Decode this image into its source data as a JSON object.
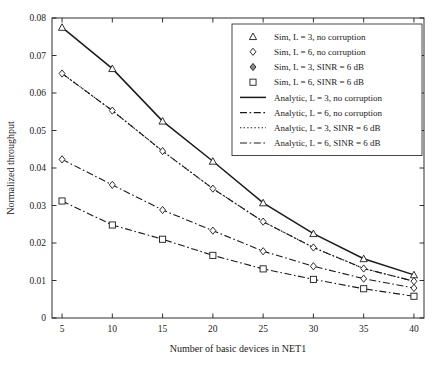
{
  "chart_data": {
    "type": "line",
    "title": "",
    "xlabel": "Number of basic devices in NET1",
    "ylabel": "Normalized throughput",
    "x": [
      5,
      10,
      15,
      20,
      25,
      30,
      35,
      40
    ],
    "xlim": [
      4,
      41
    ],
    "ylim": [
      0,
      0.08
    ],
    "xticks": [
      5,
      10,
      15,
      20,
      25,
      30,
      35,
      40
    ],
    "xtick_labels": [
      "5",
      "10",
      "15",
      "20",
      "25",
      "30",
      "35",
      "40"
    ],
    "yticks": [
      0,
      0.01,
      0.02,
      0.03,
      0.04,
      0.05,
      0.06,
      0.07,
      0.08
    ],
    "ytick_labels": [
      "0",
      "0.01",
      "0.02",
      "0.03",
      "0.04",
      "0.05",
      "0.06",
      "0.07",
      "0.08"
    ],
    "grid": false,
    "legend_position": "top-right",
    "series": [
      {
        "name": "Sim, L = 3, no corruption",
        "kind": "markers",
        "marker": "triangle",
        "color": "#1a1a1a",
        "values": [
          0.0775,
          0.0665,
          0.0525,
          0.0418,
          0.0307,
          0.0225,
          0.0158,
          0.0115
        ]
      },
      {
        "name": "Sim, L = 6, no corruption",
        "kind": "markers",
        "marker": "diamond",
        "color": "#1a1a1a",
        "values": [
          0.0652,
          0.0553,
          0.0445,
          0.0345,
          0.0257,
          0.0188,
          0.0132,
          0.0098
        ]
      },
      {
        "name": "Sim, L = 3, SINR = 6 dB",
        "kind": "markers",
        "marker": "diamond",
        "color": "#1a1a1a",
        "values": [
          0.0423,
          0.0355,
          0.0288,
          0.0233,
          0.0178,
          0.0138,
          0.0105,
          0.008
        ]
      },
      {
        "name": "Sim, L = 6, SINR = 6 dB",
        "kind": "markers",
        "marker": "square",
        "color": "#1a1a1a",
        "values": [
          0.0312,
          0.0248,
          0.021,
          0.0167,
          0.0131,
          0.0103,
          0.0078,
          0.0058
        ]
      },
      {
        "name": "Analytic, L = 3, no corruption",
        "kind": "line",
        "style": "solid",
        "color": "#1a1a1a",
        "values": [
          0.0775,
          0.0665,
          0.0525,
          0.0418,
          0.0307,
          0.0225,
          0.0158,
          0.0115
        ]
      },
      {
        "name": "Analytic, L = 6, no corruption",
        "kind": "line",
        "style": "dashdot",
        "color": "#1a1a1a",
        "values": [
          0.0652,
          0.0553,
          0.0445,
          0.0345,
          0.0257,
          0.0188,
          0.0132,
          0.0098
        ]
      },
      {
        "name": "Analytic, L = 3, SINR = 6 dB",
        "kind": "line",
        "style": "dotted",
        "color": "#1a1a1a",
        "values": [
          0.0652,
          0.0553,
          0.0445,
          0.0345,
          0.0257,
          0.0188,
          0.0132,
          0.0098
        ]
      },
      {
        "name": "Analytic, L = 6, SINR = 6 dB",
        "kind": "line",
        "style": "dashdot",
        "color": "#1a1a1a",
        "values": [
          0.0423,
          0.0355,
          0.0288,
          0.0233,
          0.0178,
          0.0138,
          0.0105,
          0.008
        ]
      },
      {
        "name": "Analytic, L = 6, SINR = 6 dB (lower)",
        "kind": "line",
        "style": "dashdot",
        "color": "#1a1a1a",
        "values": [
          0.0312,
          0.0248,
          0.021,
          0.0167,
          0.0131,
          0.0103,
          0.0078,
          0.0058
        ]
      }
    ],
    "legend_entries": [
      {
        "label": "Sim, L = 3, no corruption",
        "marker": "triangle",
        "line": "none"
      },
      {
        "label": "Sim, L = 6, no corruption",
        "marker": "diamond",
        "line": "none"
      },
      {
        "label": "Sim, L = 3, SINR = 6 dB",
        "marker": "diamond-filled",
        "line": "none"
      },
      {
        "label": "Sim, L = 6, SINR = 6 dB",
        "marker": "square",
        "line": "none"
      },
      {
        "label": "Analytic, L = 3, no corruption",
        "marker": "none",
        "line": "solid"
      },
      {
        "label": "Analytic, L = 6, no corruption",
        "marker": "none",
        "line": "dashdot"
      },
      {
        "label": "Analytic, L = 3, SINR = 6 dB",
        "marker": "none",
        "line": "dotted"
      },
      {
        "label": "Analytic, L = 6, SINR = 6 dB",
        "marker": "none",
        "line": "dashdot"
      }
    ]
  }
}
